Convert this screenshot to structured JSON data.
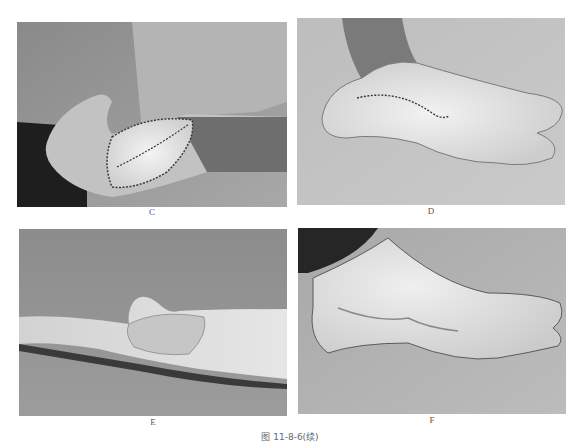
{
  "figure": {
    "caption": "图 11-8-6(续)",
    "panels": [
      {
        "id": "C",
        "label": "C",
        "description": "Hand with sutured flap on dorsum of thumb/wrist"
      },
      {
        "id": "D",
        "label": "D",
        "description": "Sole of foot with sutured incision along medial arch"
      },
      {
        "id": "E",
        "label": "E",
        "description": "Healed hand flap, lateral view"
      },
      {
        "id": "F",
        "label": "F",
        "description": "Healed foot donor site, medial view"
      }
    ]
  }
}
